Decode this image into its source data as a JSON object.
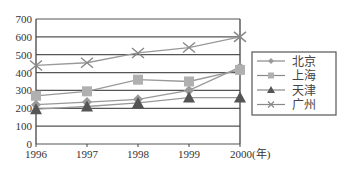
{
  "chart_data": {
    "type": "line",
    "title": "",
    "xlabel": "(年)",
    "ylabel": "",
    "categories": [
      "1996",
      "1997",
      "1998",
      "1999",
      "2000"
    ],
    "ylim": [
      0,
      700
    ],
    "yticks": [
      0,
      100,
      200,
      300,
      400,
      500,
      600,
      700
    ],
    "grid": true,
    "legend_position": "right",
    "series": [
      {
        "name": "北京",
        "marker": "diamond",
        "color": "#9a9a9a",
        "values": [
          220,
          235,
          250,
          300,
          430
        ]
      },
      {
        "name": "上海",
        "marker": "square",
        "color": "#b0b0b0",
        "values": [
          270,
          295,
          360,
          350,
          415
        ]
      },
      {
        "name": "天津",
        "marker": "triangle",
        "color": "#555555",
        "values": [
          195,
          210,
          230,
          260,
          260
        ]
      },
      {
        "name": "广州",
        "marker": "x",
        "color": "#888888",
        "values": [
          440,
          455,
          510,
          540,
          600
        ]
      }
    ]
  }
}
